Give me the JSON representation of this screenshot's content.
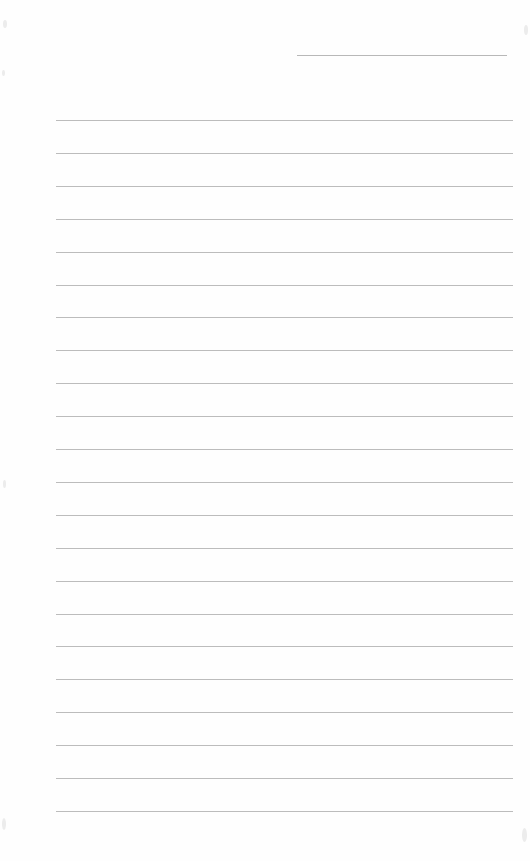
{
  "page": {
    "type": "ruled-notebook-page",
    "background_color": "#fefefe",
    "line_color": "#bcbcbc",
    "header_line": {
      "x": 297,
      "y": 55,
      "width": 210
    },
    "ruled_lines": {
      "count": 22,
      "x": 56,
      "width": 457,
      "first_y": 120,
      "spacing": 32.9
    },
    "text_content": []
  }
}
